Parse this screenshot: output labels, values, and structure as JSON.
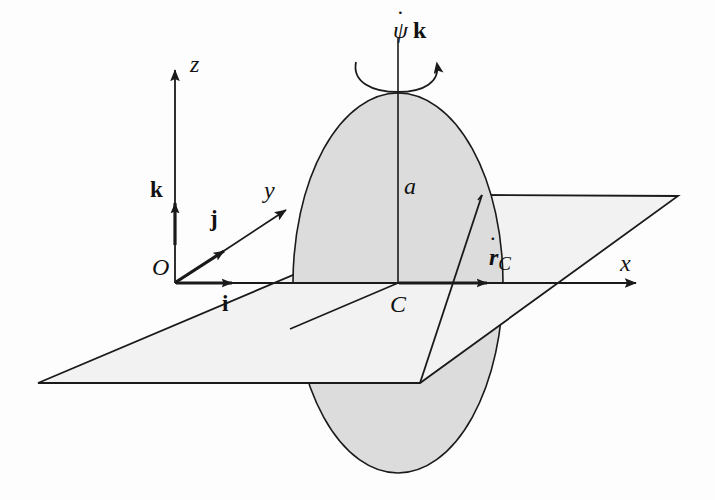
{
  "figure": {
    "kind": "mechanics-diagram",
    "colors": {
      "background": "#fdfdfd",
      "stroke": "#1a1a1a",
      "plane_fill": "#f2f2f2",
      "disc_fill": "#dcdcdc",
      "label": "#111111"
    }
  },
  "axes": {
    "x": {
      "label": "x",
      "tip": [
        640,
        283
      ]
    },
    "y": {
      "label": "y",
      "tip": [
        288,
        208
      ]
    },
    "z": {
      "label": "z",
      "tip": [
        173,
        65
      ]
    }
  },
  "points": {
    "origin": {
      "label": "O",
      "at": [
        175,
        283
      ]
    },
    "centre": {
      "label": "C",
      "at": [
        398,
        283
      ]
    }
  },
  "unit_vectors": {
    "i": {
      "label": "i",
      "note": "unit vector along x"
    },
    "j": {
      "label": "j",
      "note": "unit vector along y"
    },
    "k": {
      "label": "k",
      "note": "unit vector along z"
    }
  },
  "dimensions": {
    "radius": {
      "label": "a",
      "note": "disc radius measured from C up to rim"
    }
  },
  "vectors": {
    "spin": {
      "symbol": "ψ",
      "dot": "˙",
      "basis": "k",
      "rendered": "ψ̇ k",
      "note": "precession rate about vertical axis, curved arrow"
    },
    "velocity": {
      "symbol": "r",
      "dot": "˙",
      "subscript": "C",
      "rendered": "ṙ C",
      "note": "velocity of the centre C along x"
    }
  },
  "shapes": {
    "plane": {
      "name": "horizontal-plane",
      "corners": [
        [
          38,
          383
        ],
        [
          482,
          195
        ],
        [
          678,
          196
        ],
        [
          420,
          383
        ]
      ]
    },
    "disc": {
      "name": "rolling-disc",
      "centre": [
        398,
        283
      ],
      "rx": 105,
      "ry": 190
    }
  }
}
